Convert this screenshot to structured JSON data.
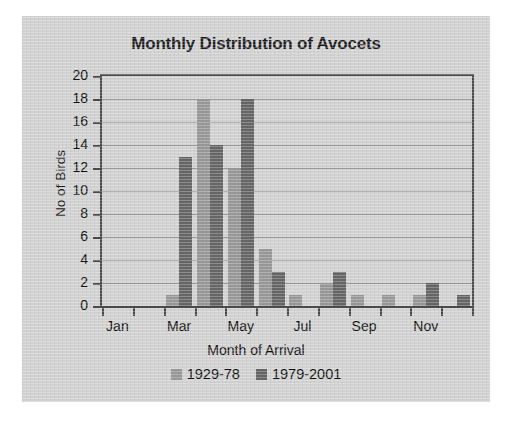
{
  "chart_data": {
    "type": "bar",
    "title": "Monthly Distribution of Avocets",
    "xlabel": "Month of Arrival",
    "ylabel": "No of Birds",
    "categories": [
      "Jan",
      "Feb",
      "Mar",
      "Apr",
      "May",
      "Jun",
      "Jul",
      "Aug",
      "Sep",
      "Oct",
      "Nov",
      "Dec"
    ],
    "tick_labels_visible": [
      "Jan",
      "",
      "Mar",
      "",
      "May",
      "",
      "Jul",
      "",
      "Sep",
      "",
      "Nov",
      ""
    ],
    "series": [
      {
        "name": "1929-78",
        "color": "#989898",
        "values": [
          0,
          0,
          1,
          18,
          12,
          5,
          1,
          2,
          1,
          1,
          1,
          0
        ]
      },
      {
        "name": "1979-2001",
        "color": "#666666",
        "values": [
          0,
          0,
          13,
          14,
          18,
          3,
          0,
          3,
          0,
          0,
          2,
          1
        ]
      }
    ],
    "ylim": [
      0,
      20
    ],
    "ytick_step": 2,
    "yticks": [
      20,
      18,
      16,
      14,
      12,
      10,
      8,
      6,
      4,
      2,
      0
    ],
    "grid": true,
    "legend_position": "bottom"
  },
  "legend": {
    "items": [
      {
        "label": "1929-78"
      },
      {
        "label": "1979-2001"
      }
    ]
  }
}
